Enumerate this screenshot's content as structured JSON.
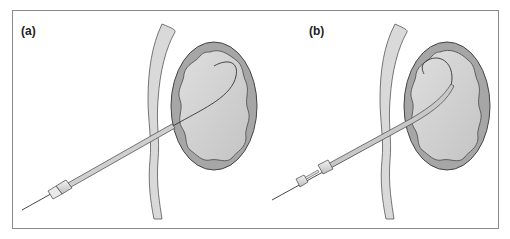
{
  "figure": {
    "panels": [
      {
        "id": "a",
        "label": "(a)",
        "description": "Needle with guidewire inserted through body wall into kidney; guidewire coiled inside renal pelvis"
      },
      {
        "id": "b",
        "label": "(b)",
        "description": "Catheter/sheath advanced over guidewire into kidney with dilator and hub connectors"
      }
    ],
    "colors": {
      "frame_border": "#8a8a8a",
      "kidney_outer": "#a6a6a6",
      "kidney_inner": "#cfcfcf",
      "tissue_band": "#d9d9d9",
      "outline": "#444444",
      "tube_fill": "#c8c8c8",
      "connector_fill": "#e0e0e0"
    }
  }
}
